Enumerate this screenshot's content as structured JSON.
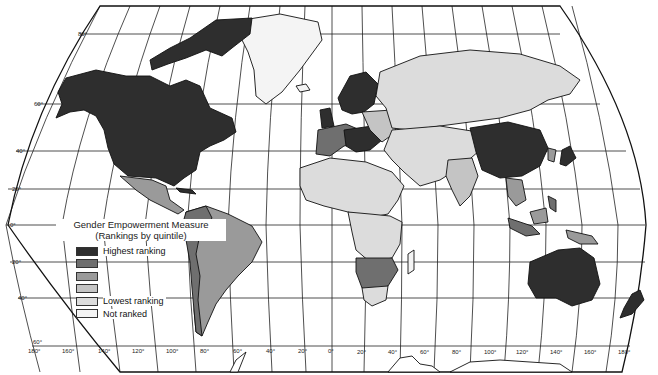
{
  "legend": {
    "title_line1": "Gender Empowerment Measure",
    "title_line2": "(Rankings by quintile)",
    "items": [
      {
        "label": "Highest ranking",
        "color": "#2e2e2e"
      },
      {
        "label": "",
        "color": "#6f6f6f"
      },
      {
        "label": "",
        "color": "#9a9a9a"
      },
      {
        "label": "",
        "color": "#c4c4c4"
      },
      {
        "label": "Lowest ranking",
        "color": "#dcdcdc"
      },
      {
        "label": "Not ranked",
        "color": "#f4f4f4"
      }
    ]
  },
  "latitude_labels": [
    "80°",
    "60°",
    "40°",
    "20°",
    "0°",
    "20°",
    "40°",
    "60°"
  ],
  "longitude_labels": [
    "180°",
    "160°",
    "140°",
    "120°",
    "100°",
    "80°",
    "60°",
    "40°",
    "20°",
    "0°",
    "20°",
    "40°",
    "60°",
    "80°",
    "100°",
    "120°",
    "140°",
    "160°",
    "180°"
  ],
  "colors": {
    "q1": "#2e2e2e",
    "q2": "#6f6f6f",
    "q3": "#9a9a9a",
    "q4": "#c4c4c4",
    "q5": "#dcdcdc",
    "not_ranked": "#f4f4f4",
    "background": "#ffffff"
  }
}
